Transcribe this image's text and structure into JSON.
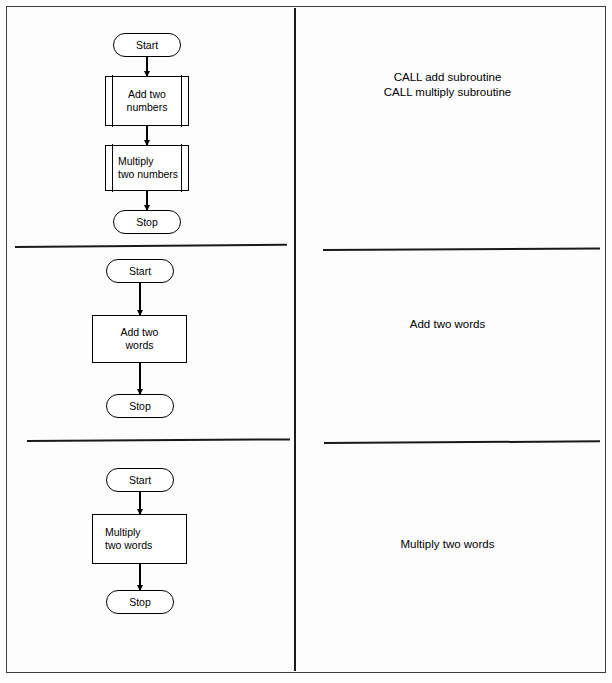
{
  "document": {
    "title": "Subroutine flowchart comparison",
    "background_color": "#fdfdfd",
    "line_color": "#000000"
  },
  "layout": {
    "columns": 2,
    "sections": 3,
    "vertical_divider_x": 295,
    "section_divider_y": [
      245,
      440
    ]
  },
  "sections": [
    {
      "id": "main-program",
      "flowchart": {
        "nodes": [
          {
            "id": "start",
            "shape": "terminator",
            "label": "Start"
          },
          {
            "id": "add",
            "shape": "subroutine",
            "label": "Add two\nnumbers"
          },
          {
            "id": "multiply",
            "shape": "subroutine",
            "label": "Multiply\ntwo numbers"
          },
          {
            "id": "stop",
            "shape": "terminator",
            "label": "Stop"
          }
        ],
        "edges": [
          {
            "from": "start",
            "to": "add"
          },
          {
            "from": "add",
            "to": "multiply"
          },
          {
            "from": "multiply",
            "to": "stop"
          }
        ]
      },
      "note": "CALL add subroutine\nCALL multiply subroutine"
    },
    {
      "id": "add-subroutine",
      "flowchart": {
        "nodes": [
          {
            "id": "start",
            "shape": "terminator",
            "label": "Start"
          },
          {
            "id": "addsub",
            "shape": "process",
            "label": "Add  two\nwords"
          },
          {
            "id": "stop",
            "shape": "terminator",
            "label": "Stop"
          }
        ],
        "edges": [
          {
            "from": "start",
            "to": "addsub"
          },
          {
            "from": "addsub",
            "to": "stop"
          }
        ]
      },
      "note": "Add two words"
    },
    {
      "id": "multiply-subroutine",
      "flowchart": {
        "nodes": [
          {
            "id": "start",
            "shape": "terminator",
            "label": "Start"
          },
          {
            "id": "mulsub",
            "shape": "process",
            "label": "Multiply\ntwo words"
          },
          {
            "id": "stop",
            "shape": "terminator",
            "label": "Stop"
          }
        ],
        "edges": [
          {
            "from": "start",
            "to": "mulsub"
          },
          {
            "from": "mulsub",
            "to": "stop"
          }
        ]
      },
      "note": "Multiply two words"
    }
  ]
}
